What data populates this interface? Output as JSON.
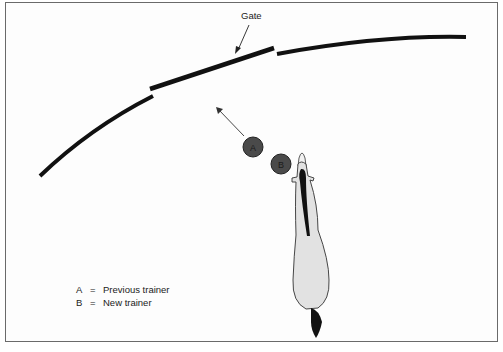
{
  "diagram": {
    "gate_label": "Gate",
    "trainers": [
      {
        "id": "A",
        "label": "A",
        "cx": 253,
        "cy": 147
      },
      {
        "id": "B",
        "label": "B",
        "cx": 281,
        "cy": 164
      }
    ],
    "legend": [
      {
        "key": "A",
        "eq": "=",
        "text": "Previous trainer"
      },
      {
        "key": "B",
        "eq": "=",
        "text": "New trainer"
      }
    ],
    "colors": {
      "fence": "#111111",
      "trainer_fill": "#4a4a4a",
      "horse_body": "#e2e2e2",
      "horse_outline": "#333333",
      "frame": "#6a6a6a"
    }
  }
}
